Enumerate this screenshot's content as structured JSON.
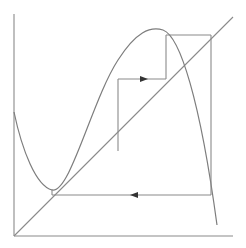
{
  "figure": {
    "type": "cobweb-diagram",
    "colors": {
      "lines": "#8a8a8a",
      "curve": "#7d7d7d",
      "arrows": "#333333",
      "background": "#ffffff"
    },
    "axes": {
      "origin": [
        14,
        236
      ],
      "x_axis_end": [
        233,
        236
      ],
      "y_axis_top": [
        14,
        14
      ]
    },
    "diagonal": {
      "from": [
        14,
        236
      ],
      "to": [
        233,
        17
      ]
    },
    "curve_path": "M14,112 C22,150 36,186 52,190 C70,194 92,100 118,60 C136,32 150,26 163,30 C180,36 200,100 217,225",
    "cobweb": [
      {
        "from": [
          118,
          151
        ],
        "to": [
          118,
          79
        ]
      },
      {
        "from": [
          118,
          79
        ],
        "to": [
          166,
          79
        ],
        "arrow": "right"
      },
      {
        "from": [
          166,
          79
        ],
        "to": [
          166,
          35
        ]
      },
      {
        "from": [
          166,
          35
        ],
        "to": [
          211,
          35
        ]
      },
      {
        "from": [
          211,
          35
        ],
        "to": [
          211,
          195
        ]
      },
      {
        "from": [
          211,
          195
        ],
        "to": [
          52,
          195
        ],
        "arrow": "left"
      },
      {
        "from": [
          52,
          195
        ],
        "to": [
          52,
          189
        ]
      }
    ],
    "arrows": [
      {
        "direction": "right",
        "at": [
          144,
          79
        ]
      },
      {
        "direction": "left",
        "at": [
          134,
          195
        ]
      }
    ]
  }
}
